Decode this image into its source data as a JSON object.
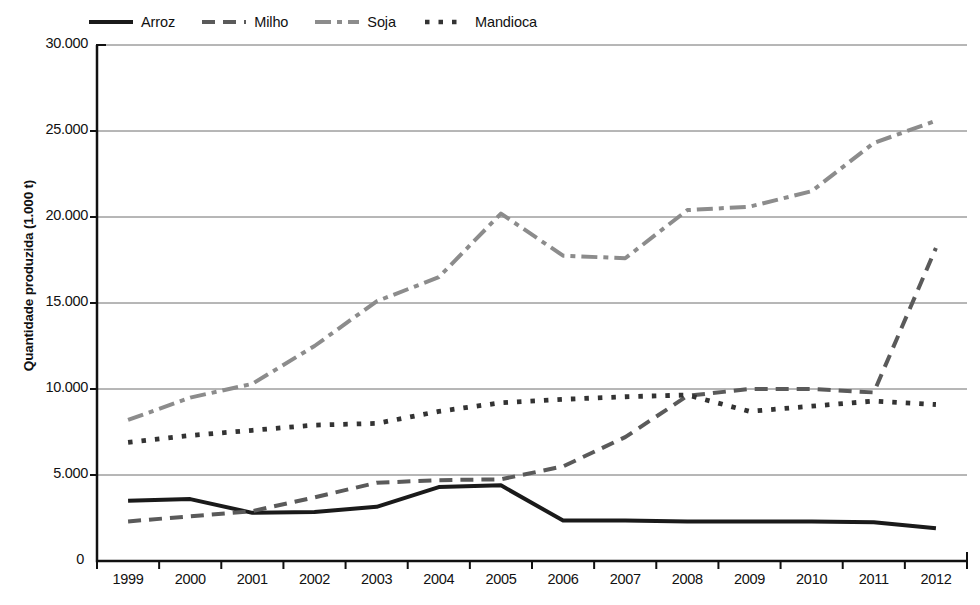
{
  "chart_data": {
    "type": "line",
    "title": "",
    "xlabel": "",
    "ylabel": "Quantidade produzida (1.000 t)",
    "x": [
      1999,
      2000,
      2001,
      2002,
      2003,
      2004,
      2005,
      2006,
      2007,
      2008,
      2009,
      2010,
      2011,
      2012
    ],
    "categories": [
      "1999",
      "2000",
      "2001",
      "2002",
      "2003",
      "2004",
      "2005",
      "2006",
      "2007",
      "2008",
      "2009",
      "2010",
      "2011",
      "2012"
    ],
    "ylim": [
      0,
      30000
    ],
    "yticks": [
      0,
      5000,
      10000,
      15000,
      20000,
      25000,
      30000
    ],
    "ytick_labels": [
      "0",
      "5.000",
      "10.000",
      "15.000",
      "20.000",
      "25.000",
      "30.000"
    ],
    "grid": true,
    "legend_position": "top-left",
    "series": [
      {
        "name": "Arroz",
        "style": "solid",
        "color": "#1a1a1a",
        "values": [
          3500,
          3600,
          2800,
          2850,
          3150,
          4300,
          4400,
          2350,
          2350,
          2300,
          2300,
          2300,
          2250,
          1900
        ]
      },
      {
        "name": "Milho",
        "style": "dashed",
        "color": "#5a5a5a",
        "values": [
          2300,
          2600,
          2900,
          3700,
          4550,
          4700,
          4750,
          5500,
          7200,
          9600,
          10000,
          10000,
          9800,
          18200
        ]
      },
      {
        "name": "Soja",
        "style": "dash-dot",
        "color": "#8c8c8c",
        "values": [
          8200,
          9500,
          10300,
          12500,
          15100,
          16500,
          20200,
          17750,
          17600,
          20400,
          20600,
          21500,
          24300,
          25600
        ]
      },
      {
        "name": "Mandioca",
        "style": "dotted",
        "color": "#333333",
        "values": [
          6900,
          7300,
          7600,
          7900,
          8000,
          8700,
          9200,
          9400,
          9550,
          9650,
          8700,
          9000,
          9300,
          9100
        ]
      }
    ]
  },
  "legend": {
    "items": [
      {
        "label": "Arroz",
        "key": "solid-line-key"
      },
      {
        "label": "Milho",
        "key": "dashed-line-key"
      },
      {
        "label": "Soja",
        "key": "dash-dot-line-key"
      },
      {
        "label": "Mandioca",
        "key": "dotted-line-key"
      }
    ]
  },
  "axes": {
    "y_title": "Quantidade produzida (1.000 t)"
  }
}
